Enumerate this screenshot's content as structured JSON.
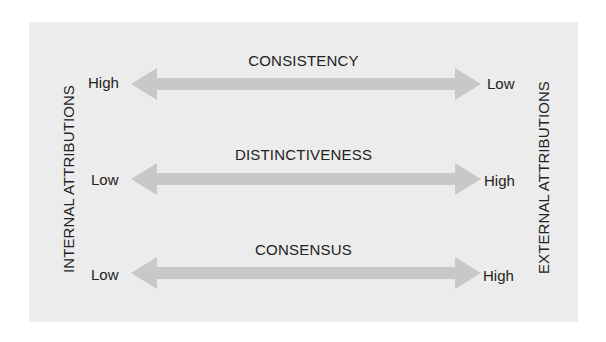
{
  "diagram": {
    "left_axis_label": "INTERNAL ATTRIBUTIONS",
    "right_axis_label": "EXTERNAL ATTRIBUTIONS",
    "rows": [
      {
        "title": "CONSISTENCY",
        "left_value": "High",
        "right_value": "Low"
      },
      {
        "title": "DISTINCTIVENESS",
        "left_value": "Low",
        "right_value": "High"
      },
      {
        "title": "CONSENSUS",
        "left_value": "Low",
        "right_value": "High"
      }
    ],
    "colors": {
      "background": "#ececec",
      "arrow": "#c8c8c8",
      "text": "#222222"
    }
  }
}
